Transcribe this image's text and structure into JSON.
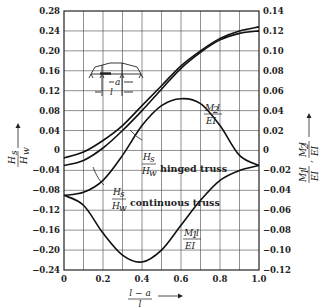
{
  "chart_data": {
    "type": "line",
    "title": "",
    "xlabel": "(l - a) / l",
    "ylabel_left": "H_s / H_w",
    "ylabel_right": "M_1 l / EI , M_2 l / EI",
    "xlim": [
      0,
      1.0
    ],
    "ylim_left": [
      -0.24,
      0.28
    ],
    "ylim_right": [
      -0.12,
      0.14
    ],
    "grid": true,
    "x_ticks": [
      "0",
      "0.2",
      "0.4",
      "0.6",
      "0.8",
      "1.0"
    ],
    "y_ticks_left": [
      "0.28",
      "0.24",
      "0.20",
      "0.16",
      "0.12",
      "0.08",
      "0.04",
      "0",
      "-0.04",
      "-0.08",
      "-0.12",
      "-0.16",
      "-0.20",
      "-0.24"
    ],
    "y_ticks_right": [
      "0.14",
      "0.12",
      "0.10",
      "0.08",
      "0.06",
      "0.04",
      "0.02",
      "0",
      "-0.02",
      "-0.04",
      "-0.06",
      "-0.08",
      "-0.10",
      "-0.12"
    ],
    "x": [
      0,
      0.1,
      0.2,
      0.3,
      0.4,
      0.5,
      0.6,
      0.7,
      0.8,
      0.9,
      1.0
    ],
    "series": [
      {
        "name": "H_s/H_w hinged truss",
        "axis": "left",
        "values": [
          -0.015,
          -0.003,
          0.02,
          0.05,
          0.09,
          0.13,
          0.17,
          0.2,
          0.225,
          0.24,
          0.248
        ]
      },
      {
        "name": "H_s/H_w continuous truss",
        "axis": "left",
        "values": [
          -0.03,
          -0.02,
          0.005,
          0.04,
          0.08,
          0.123,
          0.165,
          0.197,
          0.222,
          0.235,
          0.24
        ]
      },
      {
        "name": "M_2 l/EI",
        "axis": "right",
        "values": [
          -0.045,
          -0.042,
          -0.03,
          -0.005,
          0.025,
          0.045,
          0.052,
          0.047,
          0.025,
          -0.005,
          -0.015
        ]
      },
      {
        "name": "M_1 l/EI",
        "axis": "right",
        "values": [
          -0.045,
          -0.055,
          -0.083,
          -0.105,
          -0.112,
          -0.1,
          -0.075,
          -0.05,
          -0.03,
          -0.02,
          -0.015
        ]
      }
    ],
    "annotations": [
      "hinged truss",
      "continuous truss",
      "M_2 l / EI",
      "M_1 l / EI",
      "inset: truss sketch with dimensions a and l"
    ]
  },
  "labels": {
    "hinged": "hinged truss",
    "continuous": "continuous truss",
    "hs": "H",
    "hs_sub": "s",
    "hw": "H",
    "hw_sub": "w",
    "m2_num": "M",
    "m2_sub": "2",
    "m1_num": "M",
    "m1_sub": "1",
    "l": "l",
    "ei": "EI",
    "x_num": "l − a",
    "x_den": "l",
    "inset_a": "a",
    "inset_l": "l"
  }
}
